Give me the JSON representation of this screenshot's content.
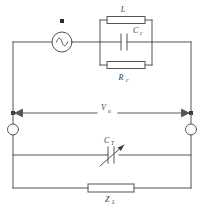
{
  "diagram": {
    "type": "electrical-schematic",
    "stroke_color": "#555555",
    "label_color": "#3a3a3a",
    "background": "#ffffff"
  },
  "components": {
    "source": {
      "name": "ac-voltage-source",
      "symbol": "circle-with-sine-wave",
      "marker": "square-dot",
      "label": ""
    },
    "inductor": {
      "name": "inductor",
      "symbol": "rectangle-box",
      "label": "L",
      "subscript": ""
    },
    "coupling_capacitor": {
      "name": "coupling-capacitor",
      "symbol": "two-parallel-plates",
      "label": "C",
      "subscript": "c"
    },
    "coil_resistor": {
      "name": "coil-resistance",
      "symbol": "rectangle-box",
      "label": "R",
      "subscript": "c"
    },
    "tuning_capacitor": {
      "name": "variable-tuning-capacitor",
      "symbol": "variable-capacitor-arrow",
      "label": "C",
      "subscript": "T"
    },
    "load": {
      "name": "load-impedance",
      "symbol": "rectangle-box",
      "label": "Z",
      "subscript": "L"
    }
  },
  "measurements": {
    "voltage": {
      "name": "terminal-voltage",
      "label": "V",
      "subscript": "u",
      "arrow_style": "double-headed"
    }
  },
  "terminals": {
    "left": {
      "name": "left-terminal",
      "symbol": "open-circle"
    },
    "right": {
      "name": "right-terminal",
      "symbol": "open-circle"
    }
  },
  "nodes": {
    "left_junction": {
      "name": "left-junction-dot",
      "symbol": "filled-square"
    },
    "right_junction": {
      "name": "right-junction-dot",
      "symbol": "filled-square"
    }
  }
}
